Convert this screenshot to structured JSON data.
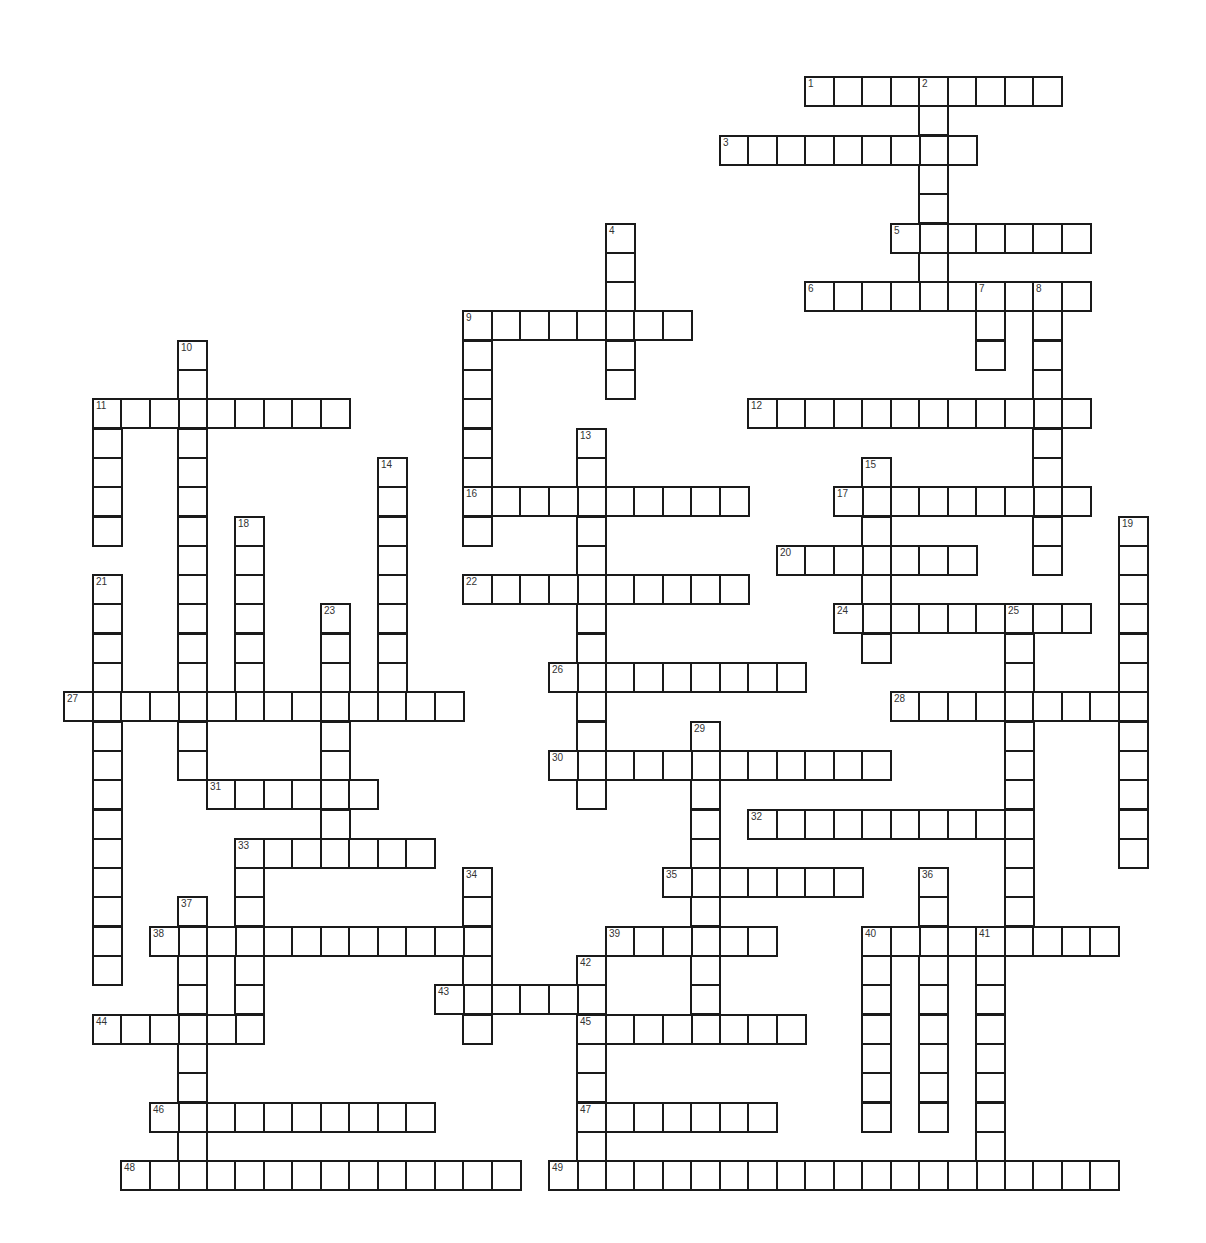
{
  "puzzle": {
    "title": "",
    "grid": {
      "origin_x": 63,
      "origin_y": 76,
      "cell_w": 28.5,
      "cell_h": 29.3
    },
    "colors": {
      "border": "#1a1a1a",
      "cell_bg": "#ffffff",
      "number": "#333333"
    },
    "words": [
      {
        "num": 1,
        "dir": "across",
        "col": 26,
        "row": 0,
        "len": 9
      },
      {
        "num": 2,
        "dir": "down",
        "col": 30,
        "row": 0,
        "len": 8
      },
      {
        "num": 3,
        "dir": "across",
        "col": 23,
        "row": 2,
        "len": 9
      },
      {
        "num": 4,
        "dir": "down",
        "col": 19,
        "row": 5,
        "len": 6
      },
      {
        "num": 5,
        "dir": "across",
        "col": 29,
        "row": 5,
        "len": 7
      },
      {
        "num": 6,
        "dir": "across",
        "col": 26,
        "row": 7,
        "len": 10
      },
      {
        "num": 7,
        "dir": "down",
        "col": 32,
        "row": 7,
        "len": 3
      },
      {
        "num": 8,
        "dir": "down",
        "col": 34,
        "row": 7,
        "len": 10
      },
      {
        "num": 9,
        "dir": "across",
        "col": 14,
        "row": 8,
        "len": 8
      },
      {
        "num": 9,
        "dir": "down",
        "col": 14,
        "row": 8,
        "len": 8
      },
      {
        "num": 10,
        "dir": "down",
        "col": 4,
        "row": 9,
        "len": 15
      },
      {
        "num": 11,
        "dir": "across",
        "col": 1,
        "row": 11,
        "len": 9
      },
      {
        "num": 11,
        "dir": "down",
        "col": 1,
        "row": 11,
        "len": 5
      },
      {
        "num": 12,
        "dir": "across",
        "col": 24,
        "row": 11,
        "len": 12
      },
      {
        "num": 13,
        "dir": "down",
        "col": 18,
        "row": 12,
        "len": 13
      },
      {
        "num": 14,
        "dir": "down",
        "col": 11,
        "row": 13,
        "len": 9
      },
      {
        "num": 15,
        "dir": "down",
        "col": 28,
        "row": 13,
        "len": 7
      },
      {
        "num": 16,
        "dir": "across",
        "col": 14,
        "row": 14,
        "len": 10
      },
      {
        "num": 17,
        "dir": "across",
        "col": 27,
        "row": 14,
        "len": 9
      },
      {
        "num": 18,
        "dir": "down",
        "col": 6,
        "row": 15,
        "len": 7
      },
      {
        "num": 19,
        "dir": "down",
        "col": 37,
        "row": 15,
        "len": 12
      },
      {
        "num": 20,
        "dir": "across",
        "col": 25,
        "row": 16,
        "len": 7
      },
      {
        "num": 21,
        "dir": "down",
        "col": 1,
        "row": 17,
        "len": 14
      },
      {
        "num": 22,
        "dir": "across",
        "col": 14,
        "row": 17,
        "len": 10
      },
      {
        "num": 23,
        "dir": "down",
        "col": 9,
        "row": 18,
        "len": 9
      },
      {
        "num": 24,
        "dir": "across",
        "col": 27,
        "row": 18,
        "len": 9
      },
      {
        "num": 25,
        "dir": "down",
        "col": 33,
        "row": 18,
        "len": 12
      },
      {
        "num": 26,
        "dir": "across",
        "col": 17,
        "row": 20,
        "len": 9
      },
      {
        "num": 27,
        "dir": "across",
        "col": 0,
        "row": 21,
        "len": 14
      },
      {
        "num": 28,
        "dir": "across",
        "col": 29,
        "row": 21,
        "len": 9
      },
      {
        "num": 29,
        "dir": "down",
        "col": 22,
        "row": 22,
        "len": 11
      },
      {
        "num": 30,
        "dir": "across",
        "col": 17,
        "row": 23,
        "len": 12
      },
      {
        "num": 31,
        "dir": "across",
        "col": 5,
        "row": 24,
        "len": 6
      },
      {
        "num": 32,
        "dir": "across",
        "col": 24,
        "row": 25,
        "len": 10
      },
      {
        "num": 33,
        "dir": "across",
        "col": 6,
        "row": 26,
        "len": 7
      },
      {
        "num": 33,
        "dir": "down",
        "col": 6,
        "row": 26,
        "len": 7
      },
      {
        "num": 34,
        "dir": "down",
        "col": 14,
        "row": 27,
        "len": 6
      },
      {
        "num": 35,
        "dir": "across",
        "col": 21,
        "row": 27,
        "len": 7
      },
      {
        "num": 36,
        "dir": "down",
        "col": 30,
        "row": 27,
        "len": 9
      },
      {
        "num": 37,
        "dir": "down",
        "col": 4,
        "row": 28,
        "len": 10
      },
      {
        "num": 38,
        "dir": "across",
        "col": 3,
        "row": 29,
        "len": 12
      },
      {
        "num": 39,
        "dir": "across",
        "col": 19,
        "row": 29,
        "len": 6
      },
      {
        "num": 40,
        "dir": "across",
        "col": 28,
        "row": 29,
        "len": 9
      },
      {
        "num": 40,
        "dir": "down",
        "col": 28,
        "row": 29,
        "len": 7
      },
      {
        "num": 41,
        "dir": "down",
        "col": 32,
        "row": 29,
        "len": 9
      },
      {
        "num": 42,
        "dir": "down",
        "col": 18,
        "row": 30,
        "len": 8
      },
      {
        "num": 43,
        "dir": "across",
        "col": 13,
        "row": 31,
        "len": 6
      },
      {
        "num": 44,
        "dir": "across",
        "col": 1,
        "row": 32,
        "len": 6
      },
      {
        "num": 45,
        "dir": "across",
        "col": 18,
        "row": 32,
        "len": 8
      },
      {
        "num": 46,
        "dir": "across",
        "col": 3,
        "row": 35,
        "len": 10
      },
      {
        "num": 47,
        "dir": "across",
        "col": 18,
        "row": 35,
        "len": 7
      },
      {
        "num": 48,
        "dir": "across",
        "col": 2,
        "row": 37,
        "len": 14
      },
      {
        "num": 49,
        "dir": "across",
        "col": 17,
        "row": 37,
        "len": 20
      }
    ]
  }
}
